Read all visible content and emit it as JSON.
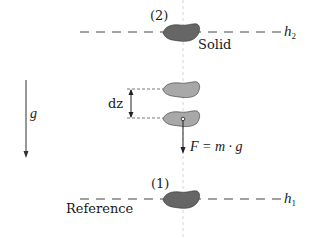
{
  "diagram": {
    "title": "",
    "colors": {
      "line": "#222222",
      "dash": "#444444",
      "center_axis": "#bbbbbb",
      "solid_dark": "#666666",
      "solid_light": "#a8a8a8",
      "text": "#1a1a1a"
    },
    "levels": {
      "top": {
        "marker": "(2)",
        "line_label_main": "h",
        "line_label_sub": "2",
        "object_label": "Solid"
      },
      "bottom": {
        "marker": "(1)",
        "line_label_main": "h",
        "line_label_sub": "1",
        "object_label": "Reference"
      }
    },
    "middle": {
      "displacement_label": "dz",
      "force_label": "F = m · g"
    },
    "gravity": {
      "label": "g⃗"
    }
  }
}
